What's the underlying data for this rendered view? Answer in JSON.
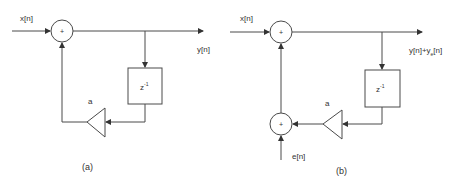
{
  "diagrams": [
    {
      "caption": "(a)",
      "input_label": "x[n]",
      "output_label": "y[n]",
      "gain_label": "a",
      "delay_label": "z",
      "delay_exponent": "-1",
      "adder_symbol": "+"
    },
    {
      "caption": "(b)",
      "input_label": "x[n]",
      "output_label_main": "y[n]+y",
      "output_label_sub": "e",
      "output_label_tail": "[n]",
      "gain_label": "a",
      "delay_label": "z",
      "delay_exponent": "-1",
      "adder_symbol": "+",
      "error_label": "e[n]"
    }
  ],
  "colors": {
    "stroke": "#4a4a4a",
    "text": "#333333",
    "background": "#ffffff"
  }
}
